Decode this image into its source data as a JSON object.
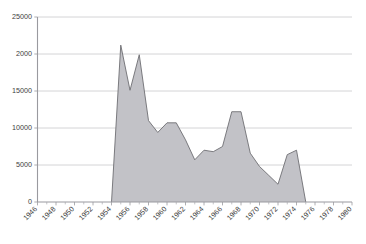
{
  "chart_data": {
    "type": "area",
    "title": "",
    "subtitle": "",
    "xlabel": "",
    "ylabel": "",
    "grid": "horizontal",
    "legend": "none",
    "xlim": [
      1946,
      1980
    ],
    "ylim": [
      0,
      25000
    ],
    "y_ticks": [
      0,
      5000,
      10000,
      15000,
      20000,
      25000
    ],
    "y_tick_labels": [
      "0",
      "5000",
      "10000",
      "15000",
      "2000",
      "25000"
    ],
    "x_ticks": [
      1946,
      1948,
      1950,
      1952,
      1954,
      1956,
      1958,
      1960,
      1962,
      1964,
      1966,
      1968,
      1970,
      1972,
      1974,
      1976,
      1978,
      1980
    ],
    "x_tick_labels": [
      "1946",
      "1948",
      "1950",
      "1952",
      "1954",
      "1956",
      "1958",
      "1960",
      "1962",
      "1964",
      "1966",
      "1968",
      "1970",
      "1972",
      "1974",
      "1976",
      "1978",
      "1980"
    ],
    "x_minor_tick_step": 1,
    "x": [
      1954,
      1955,
      1956,
      1957,
      1958,
      1959,
      1960,
      1961,
      1962,
      1963,
      1964,
      1965,
      1966,
      1967,
      1968,
      1969,
      1970,
      1971,
      1972,
      1973,
      1974,
      1975
    ],
    "values": [
      0,
      21200,
      15100,
      19900,
      11000,
      9400,
      10700,
      10700,
      8400,
      5700,
      7000,
      6800,
      7500,
      12200,
      12200,
      6600,
      4800,
      3600,
      2400,
      6400,
      7000,
      0
    ],
    "series": [
      {
        "name": "series-1",
        "x": [
          1954,
          1955,
          1956,
          1957,
          1958,
          1959,
          1960,
          1961,
          1962,
          1963,
          1964,
          1965,
          1966,
          1967,
          1968,
          1969,
          1970,
          1971,
          1972,
          1973,
          1974,
          1975
        ],
        "values": [
          0,
          21200,
          15100,
          19900,
          11000,
          9400,
          10700,
          10700,
          8400,
          5700,
          7000,
          6800,
          7500,
          12200,
          12200,
          6600,
          4800,
          3600,
          2400,
          6400,
          7000,
          0
        ],
        "fill_color": "#c2c2c7",
        "line_color": "#6e6e73"
      }
    ],
    "colors": {
      "area_fill": "#c2c2c7",
      "area_line": "#6e6e73",
      "gridline": "#c9c9cc",
      "axis": "#9a9a9f",
      "tick_text": "#3d3d3d",
      "background": "#ffffff"
    }
  }
}
